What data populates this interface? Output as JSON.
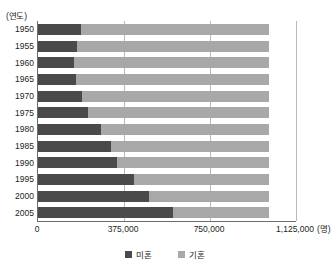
{
  "chart_data": {
    "type": "bar",
    "orientation": "horizontal",
    "stacked": true,
    "title": "",
    "xlabel": "(명)",
    "ylabel": "(연도)",
    "categories": [
      "1950",
      "1955",
      "1960",
      "1965",
      "1970",
      "1975",
      "1980",
      "1985",
      "1990",
      "1995",
      "2000",
      "2005"
    ],
    "series": [
      {
        "name": "미혼",
        "color": "#4a4a4a",
        "values": [
          187000,
          170000,
          157000,
          166000,
          192000,
          218000,
          275000,
          318000,
          344000,
          418000,
          484000,
          588000
        ]
      },
      {
        "name": "기혼",
        "color": "#a8a8a8",
        "values": [
          819000,
          836000,
          849000,
          840000,
          814000,
          788000,
          731000,
          688000,
          662000,
          588000,
          522000,
          418000
        ]
      }
    ],
    "totals": [
      1006000,
      1006000,
      1006000,
      1006000,
      1006000,
      1006000,
      1006000,
      1006000,
      1006000,
      1006000,
      1006000,
      1006000
    ],
    "xlim": [
      0,
      1125000
    ],
    "xticks": [
      0,
      375000,
      750000,
      1125000
    ],
    "xtick_labels": [
      "0",
      "375,000",
      "750,000",
      "1,125,000"
    ],
    "grid": "vertical",
    "legend_position": "bottom-center",
    "legend_entries": [
      "미혼",
      "기혼"
    ]
  },
  "axes": {
    "y_unit_label": "(연도)",
    "x_unit_label": "(명)"
  }
}
